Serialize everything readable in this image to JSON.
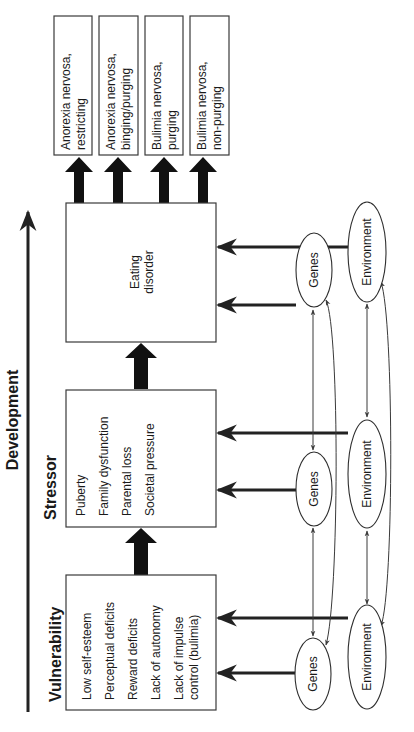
{
  "diagram": {
    "axis_label": "Development",
    "stages": [
      {
        "title": "Vulnerability",
        "items": [
          "Low self-esteem",
          "Perceptual deficits",
          "Reward deficits",
          "Lack of autonomy",
          "Lack of impulse",
          "control (bulimia)"
        ]
      },
      {
        "title": "Stressor",
        "items": [
          "Puberty",
          "Family dysfunction",
          "Parental loss",
          "Societal pressure"
        ]
      },
      {
        "title": "",
        "label_line1": "Eating",
        "label_line2": "disorder"
      }
    ],
    "outcomes": [
      {
        "line1": "Anorexia nervosa,",
        "line2": "restricting"
      },
      {
        "line1": "Anorexia nervosa,",
        "line2": "binging/purging"
      },
      {
        "line1": "Bulimia nervosa,",
        "line2": "purging"
      },
      {
        "line1": "Bulimia nervosa,",
        "line2": "non-purging"
      }
    ],
    "factors": {
      "genes": "Genes",
      "environment": "Environment"
    }
  }
}
